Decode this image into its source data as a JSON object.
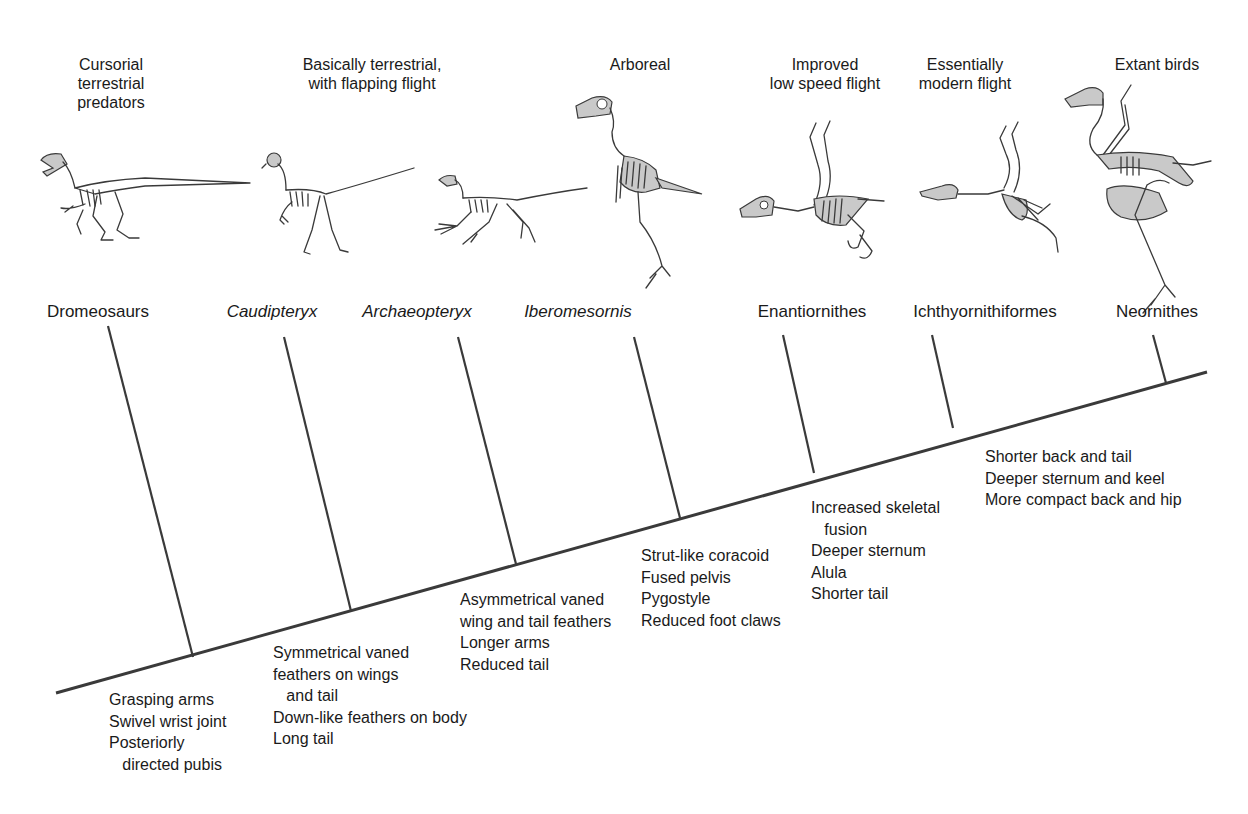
{
  "diagram": {
    "type": "cladogram",
    "line_color": "#3a3a3a",
    "text_color": "#1a1a1a",
    "trunk": {
      "start": [
        56,
        693
      ],
      "end": [
        1207,
        372
      ]
    },
    "taxa": [
      {
        "name": "Dromeosaurs",
        "italic": false,
        "habitat": "Cursorial\nterrestrial\npredators",
        "branch": {
          "top": [
            108,
            326
          ],
          "node": [
            193,
            657
          ]
        },
        "traits": "Grasping arms\nSwivel wrist joint\nPosteriorly\n   directed pubis"
      },
      {
        "name": "Caudipteryx",
        "italic": true,
        "habitat": "Basically terrestrial,\nwith flapping flight",
        "branch": {
          "top": [
            284,
            337
          ],
          "node": [
            351,
            611
          ]
        },
        "traits": "Symmetrical vaned\nfeathers on wings\n   and tail\nDown-like feathers on body\nLong tail"
      },
      {
        "name": "Archaeopteryx",
        "italic": true,
        "habitat": "",
        "branch": {
          "top": [
            458,
            337
          ],
          "node": [
            516,
            564
          ]
        },
        "traits": "Asymmetrical vaned\nwing and tail feathers\nLonger arms\nReduced tail"
      },
      {
        "name": "Iberomesornis",
        "italic": true,
        "habitat": "Arboreal",
        "branch": {
          "top": [
            634,
            337
          ],
          "node": [
            680,
            518
          ]
        },
        "traits": "Strut-like coracoid\nFused pelvis\nPygostyle\nReduced foot claws"
      },
      {
        "name": "Enantiornithes",
        "italic": false,
        "habitat": "Improved\nlow speed flight",
        "branch": {
          "top": [
            783,
            335
          ],
          "node": [
            814,
            473
          ]
        },
        "traits": "Increased skeletal\n   fusion\nDeeper sternum\nAlula\nShorter tail"
      },
      {
        "name": "Ichthyornithiformes",
        "italic": false,
        "habitat": "Essentially\nmodern flight",
        "branch": {
          "top": [
            932,
            335
          ],
          "node": [
            953,
            428
          ]
        },
        "traits": "Shorter back and tail\nDeeper sternum and keel\nMore compact back and hip"
      },
      {
        "name": "Neornithes",
        "italic": false,
        "habitat": "Extant birds",
        "branch": {
          "top": [
            1153,
            335
          ],
          "node": [
            1166,
            383
          ]
        },
        "traits": ""
      }
    ]
  },
  "habitats": [
    {
      "text": "Cursorial\nterrestrial\npredators",
      "cx": 111,
      "top": 55
    },
    {
      "text": "Basically terrestrial,\nwith flapping flight",
      "cx": 372,
      "top": 55
    },
    {
      "text": "Arboreal",
      "cx": 640,
      "top": 55
    },
    {
      "text": "Improved\nlow speed flight",
      "cx": 825,
      "top": 55
    },
    {
      "text": "Essentially\nmodern flight",
      "cx": 965,
      "top": 55
    },
    {
      "text": "Extant birds",
      "cx": 1157,
      "top": 55
    }
  ],
  "labels": [
    {
      "text": "Dromeosaurs",
      "cx": 98,
      "top": 302,
      "italic": false
    },
    {
      "text": "Caudipteryx",
      "cx": 272,
      "top": 302,
      "italic": true
    },
    {
      "text": "Archaeopteryx",
      "cx": 417,
      "top": 302,
      "italic": true
    },
    {
      "text": "Iberomesornis",
      "cx": 578,
      "top": 302,
      "italic": true
    },
    {
      "text": "Enantiornithes",
      "cx": 812,
      "top": 302,
      "italic": false
    },
    {
      "text": "Ichthyornithiformes",
      "cx": 985,
      "top": 302,
      "italic": false
    },
    {
      "text": "Neornithes",
      "cx": 1157,
      "top": 302,
      "italic": false
    }
  ],
  "trait_blocks": [
    {
      "text": "Grasping arms\nSwivel wrist joint\nPosteriorly\n   directed pubis",
      "left": 109,
      "top": 689
    },
    {
      "text": "Symmetrical vaned\nfeathers on wings\n   and tail\nDown-like feathers on body\nLong tail",
      "left": 273,
      "top": 642
    },
    {
      "text": "Asymmetrical vaned\nwing and tail feathers\nLonger arms\nReduced tail",
      "left": 460,
      "top": 589
    },
    {
      "text": "Strut-like coracoid\nFused pelvis\nPygostyle\nReduced foot claws",
      "left": 641,
      "top": 545
    },
    {
      "text": "Increased skeletal\n   fusion\nDeeper sternum\nAlula\nShorter tail",
      "left": 811,
      "top": 497
    },
    {
      "text": "Shorter back and tail\nDeeper sternum and keel\nMore compact back and hip",
      "left": 985,
      "top": 446
    }
  ],
  "skeletons": [
    {
      "icon": "dromeosaur-skeleton-icon",
      "left": 35,
      "top": 150
    },
    {
      "icon": "caudipteryx-skeleton-icon",
      "left": 262,
      "top": 150
    },
    {
      "icon": "archaeopteryx-skeleton-icon",
      "left": 417,
      "top": 150
    },
    {
      "icon": "iberomesornis-skeleton-icon",
      "left": 572,
      "top": 92
    },
    {
      "icon": "enantiornithes-skeleton-icon",
      "left": 738,
      "top": 115
    },
    {
      "icon": "ichthyornithiformes-skeleton-icon",
      "left": 918,
      "top": 120
    },
    {
      "icon": "neornithes-skeleton-icon",
      "left": 1063,
      "top": 85
    }
  ]
}
